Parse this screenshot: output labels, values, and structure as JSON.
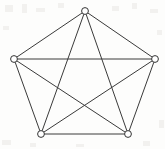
{
  "figure": {
    "width": 165,
    "height": 149,
    "background_color": "#fdfdfc",
    "edge_color": "#ララ3a3a3a",
    "vertex_stroke_color": "#333333",
    "vertex_fill_color": "#ffffff",
    "edge_width": 1,
    "vertex_radius": 3.4
  },
  "chart_data": {
    "type": "diagram",
    "diagram_kind": "graph",
    "graph_name": "K5",
    "title": "",
    "vertex_count": 5,
    "edge_count": 10,
    "directed": false,
    "weighted": false,
    "labels_shown": false,
    "vertices": [
      {
        "id": "top",
        "x": 85,
        "y": 11
      },
      {
        "id": "left",
        "x": 14,
        "y": 59
      },
      {
        "id": "right",
        "x": 155,
        "y": 59
      },
      {
        "id": "bottom_left",
        "x": 41,
        "y": 134
      },
      {
        "id": "bottom_right",
        "x": 128,
        "y": 134
      }
    ],
    "edges": [
      {
        "from": "top",
        "to": "left",
        "kind": "pentagon-side"
      },
      {
        "from": "top",
        "to": "right",
        "kind": "pentagon-side"
      },
      {
        "from": "left",
        "to": "bottom_left",
        "kind": "pentagon-side"
      },
      {
        "from": "right",
        "to": "bottom_right",
        "kind": "pentagon-side"
      },
      {
        "from": "bottom_left",
        "to": "bottom_right",
        "kind": "pentagon-side"
      },
      {
        "from": "top",
        "to": "bottom_left",
        "kind": "diagonal"
      },
      {
        "from": "top",
        "to": "bottom_right",
        "kind": "diagonal"
      },
      {
        "from": "left",
        "to": "right",
        "kind": "diagonal"
      },
      {
        "from": "left",
        "to": "bottom_right",
        "kind": "diagonal"
      },
      {
        "from": "right",
        "to": "bottom_left",
        "kind": "diagonal"
      }
    ],
    "specks": [
      {
        "x": 5,
        "y": 5,
        "w": 8,
        "h": 7
      },
      {
        "x": 22,
        "y": 4,
        "w": 5,
        "h": 9
      },
      {
        "x": 36,
        "y": 8,
        "w": 9,
        "h": 4
      },
      {
        "x": 58,
        "y": 3,
        "w": 6,
        "h": 5
      },
      {
        "x": 112,
        "y": 6,
        "w": 7,
        "h": 5
      },
      {
        "x": 132,
        "y": 3,
        "w": 5,
        "h": 6
      },
      {
        "x": 150,
        "y": 9,
        "w": 8,
        "h": 4
      },
      {
        "x": 3,
        "y": 26,
        "w": 6,
        "h": 4
      },
      {
        "x": 157,
        "y": 30,
        "w": 5,
        "h": 5
      },
      {
        "x": 2,
        "y": 140,
        "w": 9,
        "h": 5
      },
      {
        "x": 30,
        "y": 143,
        "w": 6,
        "h": 4
      },
      {
        "x": 76,
        "y": 144,
        "w": 8,
        "h": 3
      },
      {
        "x": 143,
        "y": 141,
        "w": 7,
        "h": 5
      },
      {
        "x": 159,
        "y": 120,
        "w": 5,
        "h": 8
      }
    ]
  }
}
